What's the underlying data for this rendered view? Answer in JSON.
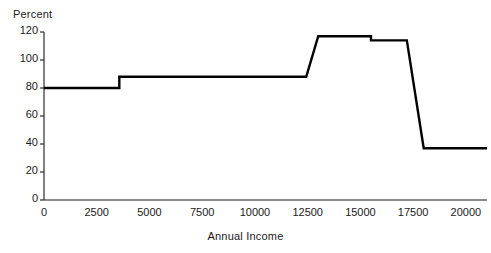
{
  "chart_data": {
    "type": "line",
    "title": "",
    "subtitle": "",
    "xlabel": "Annual Income",
    "ylabel": "Percent",
    "style": "step",
    "grid": false,
    "legend": null,
    "line_color": "#000000",
    "line_width": 2.4,
    "xlim": [
      0,
      21000
    ],
    "ylim": [
      0,
      120
    ],
    "xticks": [
      0,
      2500,
      5000,
      7500,
      10000,
      12500,
      15000,
      17500,
      20000
    ],
    "xtick_labels": [
      "0",
      "2500",
      "5000",
      "7500",
      "10000",
      "12500",
      "15000",
      "17500",
      "20000"
    ],
    "yticks": [
      0,
      20,
      40,
      60,
      80,
      100,
      120
    ],
    "ytick_labels": [
      "0",
      "20",
      "40",
      "60",
      "80",
      "100",
      "120"
    ],
    "series": [
      {
        "name": "Marginal tax rate",
        "x": [
          0,
          3570,
          3570,
          12430,
          13000,
          15500,
          15500,
          17200,
          18000,
          21000
        ],
        "y": [
          80,
          80,
          88,
          88,
          117,
          117,
          114,
          114,
          37,
          37
        ]
      }
    ],
    "step_points": [
      {
        "x_start": 0,
        "x_end": 3570,
        "value": 80
      },
      {
        "x_start": 3570,
        "x_end": 12430,
        "value": 88
      },
      {
        "x_start": 13000,
        "x_end": 15500,
        "value": 117
      },
      {
        "x_start": 15500,
        "x_end": 17200,
        "value": 114
      },
      {
        "x_start": 18000,
        "x_end": 21000,
        "value": 37
      }
    ]
  }
}
